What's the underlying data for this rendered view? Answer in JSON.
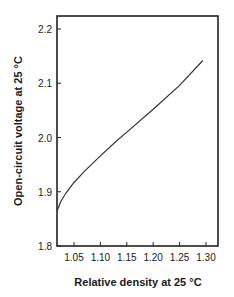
{
  "chart_data": {
    "type": "line",
    "title": "",
    "xlabel": "Relative density at 25 °C",
    "ylabel": "Open-circuit voltage at 25 °C",
    "xlim": [
      1.018,
      1.32
    ],
    "ylim": [
      1.8,
      2.225
    ],
    "xticks": [
      "1.05",
      "1.10",
      "1.15",
      "1.20",
      "1.25",
      "1.30"
    ],
    "yticks": [
      "1.8",
      "1.9",
      "2.0",
      "2.1",
      "2.2"
    ],
    "grid": false,
    "legend": null,
    "series": [
      {
        "name": "OCV vs relative density",
        "x": [
          1.018,
          1.025,
          1.035,
          1.05,
          1.07,
          1.1,
          1.13,
          1.15,
          1.2,
          1.25,
          1.294
        ],
        "y": [
          1.865,
          1.882,
          1.898,
          1.917,
          1.938,
          1.966,
          1.993,
          2.01,
          2.052,
          2.096,
          2.142
        ]
      }
    ]
  }
}
